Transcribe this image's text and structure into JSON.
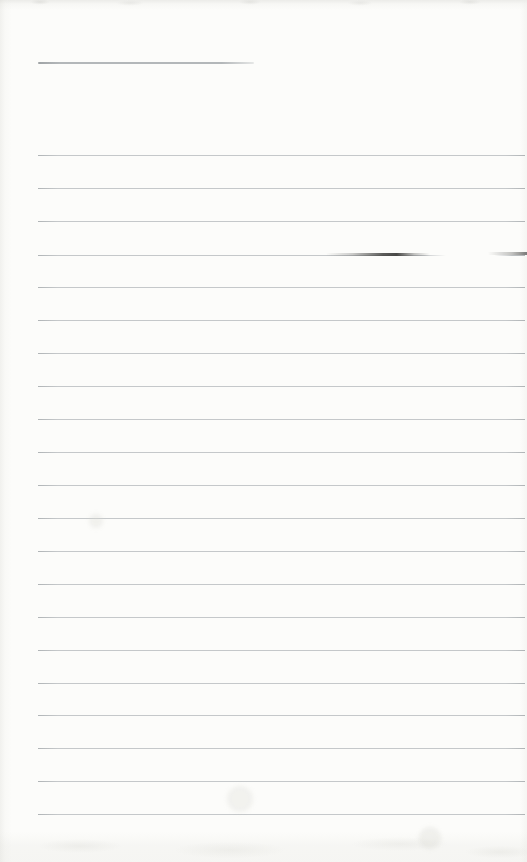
{
  "page": {
    "width_px": 527,
    "height_px": 862,
    "paper_color": "#fcfcfa",
    "edge_shade_color": "#d4d4cf"
  },
  "header_line": {
    "y": 62,
    "x_start": 38,
    "x_end": 254,
    "color": "#b3b7b9"
  },
  "ruled_lines": {
    "count": 21,
    "x_start": 38,
    "x_end": 525,
    "thickness_px": 1,
    "color": "#c5c8ca",
    "left_end_color": "#b0b4b6",
    "y_positions": [
      155,
      188,
      221,
      255,
      287,
      320,
      353,
      386,
      419,
      452,
      485,
      518,
      551,
      584,
      617,
      650,
      683,
      715,
      748,
      781,
      814
    ]
  },
  "ink_smudge": {
    "note": "dark pen-like streak overlapping ruled line 4",
    "y": 254,
    "x_start": 326,
    "x_end": 430,
    "color": "#3f3f3d"
  },
  "line_fade": {
    "note": "ruled line 4 fades out to the right of the smudge",
    "y": 254,
    "x_start": 424,
    "x_end": 512
  },
  "right_edge_streak": {
    "note": "dark streak entering from right page edge on same row as smudge",
    "y": 252,
    "x_start": 488,
    "x_end": 527,
    "color": "#5a5a58"
  },
  "bottom_shading": {
    "y_start": 832,
    "height": 30
  },
  "faint_spots": [
    {
      "x": 240,
      "y": 799,
      "d": 26,
      "color": "rgba(210,210,203,0.25)"
    },
    {
      "x": 96,
      "y": 521,
      "d": 14,
      "color": "rgba(214,214,208,0.30)"
    },
    {
      "x": 430,
      "y": 838,
      "d": 22,
      "color": "rgba(208,208,201,0.25)"
    }
  ]
}
